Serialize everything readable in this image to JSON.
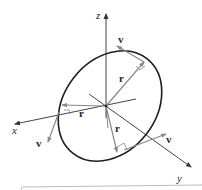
{
  "diagram": {
    "type": "3d-vector-diagram",
    "axes": {
      "x": {
        "label": "x"
      },
      "y": {
        "label": "y"
      },
      "z": {
        "label": "z"
      }
    },
    "vectors": {
      "r_label": "r",
      "v_label": "v"
    },
    "labels": {
      "r1": "r",
      "r2": "r",
      "r3": "r",
      "v1": "v",
      "v2": "v",
      "v3": "v"
    },
    "colors": {
      "axis": "#333333",
      "ellipse": "#222222",
      "vector": "#888888",
      "bottom_rule": "#bbbbbb"
    }
  }
}
